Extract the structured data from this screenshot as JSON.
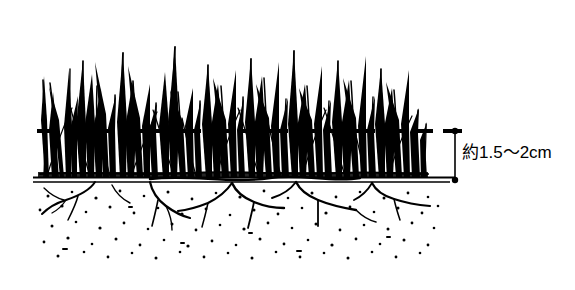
{
  "figure": {
    "ink_color": "#000000",
    "background_color": "#ffffff"
  },
  "annotations": {
    "mowing_height_label": "約1.5〜2cm"
  },
  "measurement": {
    "value_text": "約1.5〜2cm",
    "approx_prefix": "約",
    "min_value": "1.5",
    "range_separator": "〜",
    "max_value": "2",
    "unit": "cm"
  },
  "elements": {
    "cut_line_name": "cutting-height-dashed-line",
    "soil_surface_name": "soil-surface-line",
    "grass_name": "grass-blades",
    "roots_name": "grass-roots",
    "soil_name": "soil-stipple",
    "dimension_name": "height-dimension-line"
  },
  "geometry": {
    "cut_line_y": 131,
    "soil_line_y": 179,
    "dimension_x": 455,
    "grass_left": 38,
    "grass_right": 428,
    "dash_left": 37,
    "dash_right": 472
  }
}
